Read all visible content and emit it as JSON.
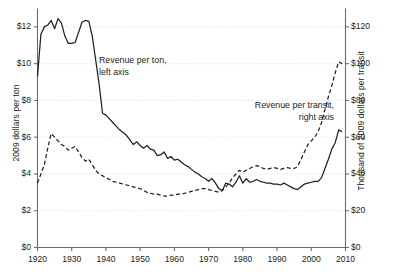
{
  "chart_data": {
    "type": "line",
    "title": "",
    "xlabel": "",
    "ylabel": "2009 dollars per ton",
    "y2label": "Thousand of 2009 dollars per transit",
    "xlim": [
      1920,
      2010
    ],
    "ylim": [
      0,
      13
    ],
    "y2lim": [
      0,
      130
    ],
    "grid": true,
    "legend_position": "inline-annotations",
    "xticks": [
      1920,
      1930,
      1940,
      1950,
      1960,
      1970,
      1980,
      1990,
      2000,
      2010
    ],
    "xtick_labels": [
      "1920",
      "1930",
      "1940",
      "1950",
      "1960",
      "1970",
      "1980",
      "1990",
      "2000",
      "2010"
    ],
    "yticks": [
      0,
      2,
      4,
      6,
      8,
      10,
      12
    ],
    "ytick_labels": [
      "$0",
      "$2",
      "$4",
      "$6",
      "$8",
      "$10",
      "$12"
    ],
    "y2ticks": [
      0,
      20,
      40,
      60,
      80,
      100,
      120
    ],
    "y2tick_labels": [
      "$0",
      "$20",
      "$40",
      "$60",
      "$80",
      "$100",
      "$120"
    ],
    "annotations": [
      {
        "name": "revenue-per-ton",
        "lines": [
          "Revenue per ton,",
          "left axis"
        ]
      },
      {
        "name": "revenue-per-transit",
        "lines": [
          "Revenue per transit,",
          "right axis"
        ]
      }
    ],
    "series": [
      {
        "name": "Revenue per ton",
        "axis": "left",
        "style": "solid",
        "color": "#231f20",
        "points": [
          [
            1920,
            9.3
          ],
          [
            1921,
            11.6
          ],
          [
            1922,
            12.0
          ],
          [
            1923,
            12.1
          ],
          [
            1924,
            12.35
          ],
          [
            1925,
            11.9
          ],
          [
            1926,
            12.45
          ],
          [
            1927,
            12.2
          ],
          [
            1928,
            11.5
          ],
          [
            1929,
            11.1
          ],
          [
            1930,
            11.1
          ],
          [
            1931,
            11.15
          ],
          [
            1932,
            11.7
          ],
          [
            1933,
            12.25
          ],
          [
            1934,
            12.35
          ],
          [
            1935,
            12.3
          ],
          [
            1936,
            11.5
          ],
          [
            1937,
            10.2
          ],
          [
            1938,
            8.9
          ],
          [
            1939,
            7.3
          ],
          [
            1940,
            7.2
          ],
          [
            1941,
            7.0
          ],
          [
            1942,
            6.8
          ],
          [
            1943,
            6.6
          ],
          [
            1944,
            6.4
          ],
          [
            1945,
            6.25
          ],
          [
            1946,
            6.1
          ],
          [
            1947,
            5.85
          ],
          [
            1948,
            5.6
          ],
          [
            1949,
            5.75
          ],
          [
            1950,
            5.55
          ],
          [
            1951,
            5.4
          ],
          [
            1952,
            5.55
          ],
          [
            1953,
            5.35
          ],
          [
            1954,
            5.3
          ],
          [
            1955,
            5.0
          ],
          [
            1956,
            5.05
          ],
          [
            1957,
            5.2
          ],
          [
            1958,
            4.85
          ],
          [
            1959,
            4.95
          ],
          [
            1960,
            4.75
          ],
          [
            1961,
            4.8
          ],
          [
            1962,
            4.65
          ],
          [
            1963,
            4.5
          ],
          [
            1964,
            4.4
          ],
          [
            1965,
            4.25
          ],
          [
            1966,
            4.1
          ],
          [
            1967,
            4.0
          ],
          [
            1968,
            3.85
          ],
          [
            1969,
            3.75
          ],
          [
            1970,
            3.6
          ],
          [
            1971,
            3.75
          ],
          [
            1972,
            3.5
          ],
          [
            1973,
            3.2
          ],
          [
            1974,
            3.1
          ],
          [
            1975,
            3.5
          ],
          [
            1976,
            3.45
          ],
          [
            1977,
            3.3
          ],
          [
            1978,
            3.55
          ],
          [
            1979,
            3.9
          ],
          [
            1980,
            3.5
          ],
          [
            1981,
            3.75
          ],
          [
            1982,
            3.55
          ],
          [
            1983,
            3.6
          ],
          [
            1984,
            3.7
          ],
          [
            1985,
            3.6
          ],
          [
            1986,
            3.55
          ],
          [
            1987,
            3.5
          ],
          [
            1988,
            3.5
          ],
          [
            1989,
            3.45
          ],
          [
            1990,
            3.45
          ],
          [
            1991,
            3.4
          ],
          [
            1992,
            3.5
          ],
          [
            1993,
            3.4
          ],
          [
            1994,
            3.3
          ],
          [
            1995,
            3.2
          ],
          [
            1996,
            3.15
          ],
          [
            1997,
            3.3
          ],
          [
            1998,
            3.45
          ],
          [
            1999,
            3.5
          ],
          [
            2000,
            3.55
          ],
          [
            2001,
            3.6
          ],
          [
            2002,
            3.6
          ],
          [
            2003,
            3.8
          ],
          [
            2004,
            4.3
          ],
          [
            2005,
            4.8
          ],
          [
            2006,
            5.35
          ],
          [
            2007,
            5.7
          ],
          [
            2008,
            6.4
          ],
          [
            2009,
            6.3
          ]
        ]
      },
      {
        "name": "Revenue per transit",
        "axis": "right",
        "style": "dashed",
        "color": "#231f20",
        "points": [
          [
            1920,
            35
          ],
          [
            1921,
            40
          ],
          [
            1922,
            45
          ],
          [
            1923,
            54
          ],
          [
            1924,
            62
          ],
          [
            1925,
            60
          ],
          [
            1926,
            58
          ],
          [
            1927,
            56
          ],
          [
            1928,
            55
          ],
          [
            1929,
            53
          ],
          [
            1930,
            54
          ],
          [
            1931,
            55
          ],
          [
            1932,
            52
          ],
          [
            1933,
            49
          ],
          [
            1934,
            47
          ],
          [
            1935,
            48
          ],
          [
            1936,
            45
          ],
          [
            1937,
            42
          ],
          [
            1938,
            40
          ],
          [
            1939,
            39
          ],
          [
            1940,
            38
          ],
          [
            1941,
            37
          ],
          [
            1942,
            36
          ],
          [
            1943,
            35.5
          ],
          [
            1944,
            35
          ],
          [
            1945,
            34.5
          ],
          [
            1946,
            34
          ],
          [
            1947,
            33.5
          ],
          [
            1948,
            33
          ],
          [
            1949,
            32.5
          ],
          [
            1950,
            32
          ],
          [
            1951,
            31
          ],
          [
            1952,
            30
          ],
          [
            1953,
            29.5
          ],
          [
            1954,
            29
          ],
          [
            1955,
            29
          ],
          [
            1956,
            28.5
          ],
          [
            1957,
            28
          ],
          [
            1958,
            28
          ],
          [
            1959,
            28.5
          ],
          [
            1960,
            28.5
          ],
          [
            1961,
            29
          ],
          [
            1962,
            29
          ],
          [
            1963,
            29.5
          ],
          [
            1964,
            30
          ],
          [
            1965,
            30.5
          ],
          [
            1966,
            31
          ],
          [
            1967,
            31.5
          ],
          [
            1968,
            32
          ],
          [
            1969,
            32
          ],
          [
            1970,
            31.5
          ],
          [
            1971,
            31
          ],
          [
            1972,
            30.5
          ],
          [
            1973,
            30
          ],
          [
            1974,
            31
          ],
          [
            1975,
            33
          ],
          [
            1976,
            35
          ],
          [
            1977,
            38
          ],
          [
            1978,
            40
          ],
          [
            1979,
            42
          ],
          [
            1980,
            41
          ],
          [
            1981,
            42
          ],
          [
            1982,
            43
          ],
          [
            1983,
            44
          ],
          [
            1984,
            44.5
          ],
          [
            1985,
            44
          ],
          [
            1986,
            43
          ],
          [
            1987,
            42.5
          ],
          [
            1988,
            43
          ],
          [
            1989,
            43.5
          ],
          [
            1990,
            43
          ],
          [
            1991,
            42.5
          ],
          [
            1992,
            43
          ],
          [
            1993,
            43.5
          ],
          [
            1994,
            43
          ],
          [
            1995,
            43
          ],
          [
            1996,
            44
          ],
          [
            1997,
            48
          ],
          [
            1998,
            52
          ],
          [
            1999,
            56
          ],
          [
            2000,
            58
          ],
          [
            2001,
            60
          ],
          [
            2002,
            63
          ],
          [
            2003,
            68
          ],
          [
            2004,
            75
          ],
          [
            2005,
            82
          ],
          [
            2006,
            88
          ],
          [
            2007,
            95
          ],
          [
            2008,
            101
          ],
          [
            2009,
            100
          ]
        ]
      }
    ]
  }
}
